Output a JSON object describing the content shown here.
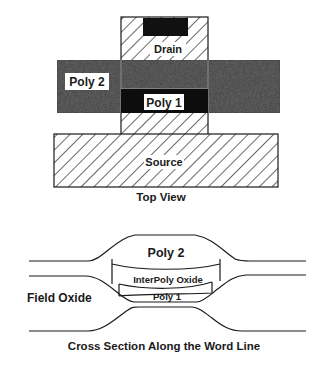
{
  "top_view": {
    "caption": "Top View",
    "labels": {
      "drain": "Drain",
      "poly2": "Poly 2",
      "poly1": "Poly 1",
      "source": "Source"
    }
  },
  "cross_section": {
    "caption": "Cross Section Along the Word Line",
    "labels": {
      "poly2": "Poly 2",
      "interpoly": "InterPoly Oxide",
      "poly1": "Poly 1",
      "field_oxide": "Field Oxide"
    }
  },
  "colors": {
    "ink": "#1a1a1a",
    "poly2_fill": "#3a3a3a",
    "poly1_fill": "#0d0d0d",
    "contact_fill": "#111111",
    "background": "#ffffff"
  }
}
